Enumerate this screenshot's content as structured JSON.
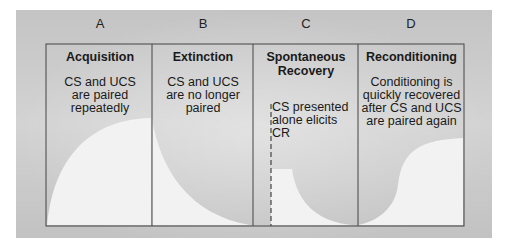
{
  "figure": {
    "background_color": "#c9c9c9",
    "curve_fill_color": "#f1f1f1",
    "border_color": "#444444",
    "columns": [
      {
        "letter": "A",
        "title": "Acquisition",
        "description": "CS and UCS are paired repeatedly",
        "description_lines": [
          "CS and UCS",
          "are paired",
          "repeatedly"
        ]
      },
      {
        "letter": "B",
        "title": "Extinction",
        "description": "CS and UCS are no longer paired",
        "description_lines": [
          "CS and UCS",
          "are no longer",
          "paired"
        ]
      },
      {
        "letter": "C",
        "title": "Spontaneous Recovery",
        "title_lines": [
          "Spontaneous",
          "Recovery"
        ],
        "description": "CS presented alone elicits CR",
        "description_lines": [
          "CS presented",
          "alone elicits CR"
        ]
      },
      {
        "letter": "D",
        "title": "Reconditioning",
        "description": "Conditioning is quickly recovered after CS and UCS are paired again",
        "description_lines": [
          "Conditioning is",
          "quickly recovered",
          "after CS and UCS",
          "are paired again"
        ]
      }
    ]
  }
}
